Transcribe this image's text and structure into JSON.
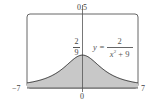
{
  "chart_data": {
    "type": "area",
    "title": "",
    "function": "y = 2/(x^2+9)",
    "xlabel": "",
    "ylabel": "",
    "xlim": [
      -7,
      7
    ],
    "ylim": [
      0,
      0.5
    ],
    "x_tick_labels": [
      "-7",
      "0",
      "7"
    ],
    "y_tick_labels": [
      "0.5"
    ],
    "annotations": [
      "2/9",
      "y = 2/(x^2+9)"
    ],
    "peak": {
      "x": 0,
      "y": 0.2222
    },
    "x": [
      -7,
      -6,
      -5,
      -4,
      -3,
      -2,
      -1,
      0,
      1,
      2,
      3,
      4,
      5,
      6,
      7
    ],
    "values": [
      0.0345,
      0.0444,
      0.0588,
      0.08,
      0.1111,
      0.1538,
      0.2,
      0.2222,
      0.2,
      0.1538,
      0.1111,
      0.08,
      0.0588,
      0.0444,
      0.0345
    ],
    "shaded_region": "area under curve from x=-7 to x=7",
    "grid": false,
    "legend": null
  },
  "labels": {
    "y_max": "0.5",
    "x_min": "−7",
    "x_max": "7",
    "x_origin": "0",
    "peak_num": "2",
    "peak_den": "9",
    "eq_lhs": "y =",
    "eq_num": "2",
    "eq_den_base": "x",
    "eq_den_exp": "2",
    "eq_den_rest": " + 9"
  },
  "colors": {
    "fill": "#c8c8c8",
    "curve": "#333333",
    "frame": "#555555",
    "axis": "#555555"
  }
}
